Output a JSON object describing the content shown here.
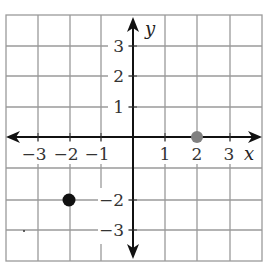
{
  "diagram": {
    "type": "coordinate-plane",
    "x_axis_label": "x",
    "y_axis_label": "y",
    "x_range": [
      -4,
      4
    ],
    "y_range": [
      -4,
      4
    ],
    "x_ticks": [
      {
        "value": -3,
        "label": "−3"
      },
      {
        "value": -2,
        "label": "−2"
      },
      {
        "value": -1,
        "label": "−1"
      },
      {
        "value": 1,
        "label": "1"
      },
      {
        "value": 2,
        "label": "2"
      },
      {
        "value": 3,
        "label": "3"
      }
    ],
    "y_ticks": [
      {
        "value": 3,
        "label": "3"
      },
      {
        "value": 2,
        "label": "2"
      },
      {
        "value": 1,
        "label": "1"
      },
      {
        "value": -2,
        "label": "−2"
      },
      {
        "value": -3,
        "label": "−3"
      }
    ],
    "points": [
      {
        "x": 2,
        "y": 0,
        "color": "#808080"
      },
      {
        "x": -2,
        "y": -2,
        "color": "#111111"
      }
    ],
    "colors": {
      "grid": "#9a9a9a",
      "axis": "#111111"
    }
  }
}
